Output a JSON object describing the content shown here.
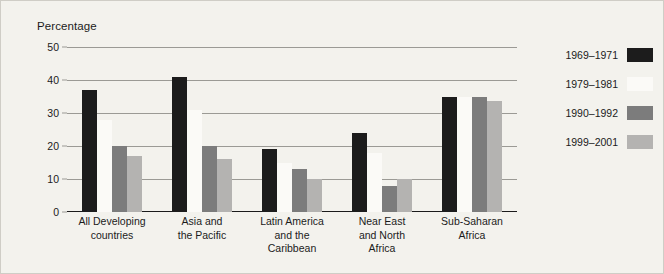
{
  "chart_data": {
    "type": "bar",
    "title": "",
    "ylabel": "Percentage",
    "xlabel": "",
    "ylim": [
      0,
      50
    ],
    "yticks": [
      0,
      10,
      20,
      30,
      40,
      50
    ],
    "grid": true,
    "legend_position": "right",
    "categories": [
      "All Developing countries",
      "Asia and the Pacific",
      "Latin America and the Caribbean",
      "Near East and North Africa",
      "Sub-Saharan Africa"
    ],
    "category_lines": [
      [
        "All Developing",
        "countries"
      ],
      [
        "Asia and",
        "the Pacific"
      ],
      [
        "Latin America",
        "and the",
        "Caribbean"
      ],
      [
        "Near East",
        "and North",
        "Africa"
      ],
      [
        "Sub-Saharan",
        "Africa"
      ]
    ],
    "series": [
      {
        "name": "1969–1971",
        "color": "#1c1c1c",
        "values": [
          37,
          41,
          19,
          24,
          35
        ]
      },
      {
        "name": "1979–1981",
        "color": "#fbfaf7",
        "values": [
          28,
          31,
          15,
          18,
          35
        ]
      },
      {
        "name": "1990–1992",
        "color": "#7c7c7c",
        "values": [
          20,
          20,
          13,
          8,
          35
        ]
      },
      {
        "name": "1999–2001",
        "color": "#b4b3b1",
        "values": [
          17,
          16,
          10,
          10,
          33.5
        ]
      }
    ]
  },
  "colors": {
    "background": "#f3f2ed",
    "border": "#cfcdc6",
    "gridline": "#9b9a95",
    "axis": "#1b1b1b",
    "text": "#1b1b1b"
  }
}
